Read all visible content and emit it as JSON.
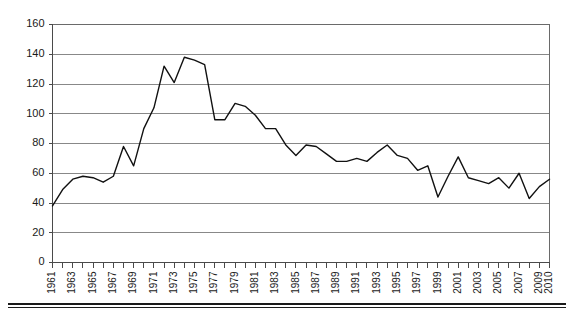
{
  "chart_data": {
    "type": "line",
    "title": "",
    "subtitle": "",
    "xlabel": "",
    "ylabel": "",
    "grid": true,
    "legend": false,
    "ylim": [
      0,
      160
    ],
    "ytick_step": 20,
    "ytick_labels": [
      "0",
      "20",
      "40",
      "60",
      "80",
      "100",
      "120",
      "140",
      "160"
    ],
    "xlim": [
      1961,
      2010
    ],
    "xtick_labels": [
      "1961",
      "1963",
      "1965",
      "1967",
      "1969",
      "1971",
      "1973",
      "1975",
      "1977",
      "1979",
      "1981",
      "1983",
      "1985",
      "1987",
      "1989",
      "1991",
      "1993",
      "1995",
      "1997",
      "1999",
      "2001",
      "2003",
      "2005",
      "2007",
      "2009",
      "2010"
    ],
    "x": [
      1961,
      1962,
      1963,
      1964,
      1965,
      1966,
      1967,
      1968,
      1969,
      1970,
      1971,
      1972,
      1973,
      1974,
      1975,
      1976,
      1977,
      1978,
      1979,
      1980,
      1981,
      1982,
      1983,
      1984,
      1985,
      1986,
      1987,
      1988,
      1989,
      1990,
      1991,
      1992,
      1993,
      1994,
      1995,
      1996,
      1997,
      1998,
      1999,
      2000,
      2001,
      2002,
      2003,
      2004,
      2005,
      2006,
      2007,
      2008,
      2009,
      2010
    ],
    "values": [
      38,
      49,
      56,
      58,
      57,
      54,
      58,
      78,
      65,
      90,
      104,
      132,
      121,
      138,
      136,
      133,
      96,
      96,
      107,
      105,
      99,
      90,
      90,
      79,
      72,
      79,
      78,
      73,
      68,
      68,
      70,
      68,
      74,
      79,
      72,
      70,
      62,
      65,
      44,
      58,
      71,
      57,
      55,
      53,
      57,
      50,
      60,
      43,
      51,
      56
    ],
    "series": [
      {
        "name": "series-1",
        "color": "#111111",
        "values": [
          38,
          49,
          56,
          58,
          57,
          54,
          58,
          78,
          65,
          90,
          104,
          132,
          121,
          138,
          136,
          133,
          96,
          96,
          107,
          105,
          99,
          90,
          90,
          79,
          72,
          79,
          78,
          73,
          68,
          68,
          70,
          68,
          74,
          79,
          72,
          70,
          62,
          65,
          44,
          58,
          71,
          57,
          55,
          53,
          57,
          50,
          60,
          43,
          51,
          56
        ]
      }
    ]
  },
  "colors": {
    "grid": "#888888",
    "axis": "#4a4a4a",
    "line": "#111111",
    "background": "#ffffff"
  }
}
